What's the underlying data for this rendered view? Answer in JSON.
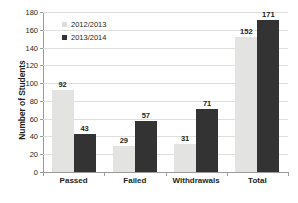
{
  "chart_data": {
    "type": "bar",
    "title": "",
    "subtitle": "",
    "xlabel": "",
    "ylabel": "Number of Students",
    "ylim": [
      0,
      180
    ],
    "ytick_step": 20,
    "yticks": [
      0,
      20,
      40,
      60,
      80,
      100,
      120,
      140,
      160,
      180
    ],
    "grid": true,
    "grid_axis": "y",
    "legend_position": "top-left-inside",
    "categories": [
      "Passed",
      "Failed",
      "Withdrawals",
      "Total"
    ],
    "series": [
      {
        "name": "2012/2013",
        "color": "#e3e3e1",
        "legend_swatch": "square",
        "values": [
          92,
          29,
          31,
          152
        ]
      },
      {
        "name": "2013/2014",
        "color": "#333333",
        "legend_swatch": "square",
        "values": [
          43,
          57,
          71,
          171
        ]
      }
    ],
    "data_labels": {
      "2012/2013": [
        "92",
        "29",
        "31",
        "152"
      ],
      "2013/2014": [
        "43",
        "57",
        "71",
        "171"
      ]
    }
  },
  "colors": {
    "background": "#ffffff",
    "axis": "#9b9b9b",
    "gridline": "#dededc",
    "text": "#231f20",
    "series_2012_2013": "#e3e3e1",
    "series_2013_2014": "#333333"
  }
}
